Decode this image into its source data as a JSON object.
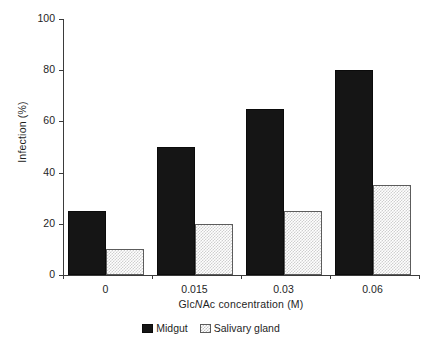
{
  "chart_data": {
    "type": "bar",
    "title": "",
    "xlabel": "GlcNAc concentration (M)",
    "xlabel_parts": {
      "pre": "Glc",
      "italic": "N",
      "post": "Ac concentration (M)"
    },
    "ylabel": "Infection (%)",
    "categories": [
      "0",
      "0.015",
      "0.03",
      "0.06"
    ],
    "series": [
      {
        "name": "Midgut",
        "values": [
          25,
          50,
          65,
          80
        ],
        "color": "#151515",
        "pattern": "solid"
      },
      {
        "name": "Salivary gland",
        "values": [
          10,
          20,
          25,
          35
        ],
        "color": "#cfcfcf",
        "pattern": "checker"
      }
    ],
    "ylim": [
      0,
      100
    ],
    "yticks": [
      0,
      20,
      40,
      60,
      80,
      100
    ],
    "ytick_labels": [
      "0",
      "20",
      "40",
      "60",
      "80",
      "100"
    ],
    "grid": false,
    "legend_position": "bottom-center",
    "axis_color": "#3b3b3b",
    "background": "#ffffff"
  },
  "legend": {
    "items": [
      {
        "label": "Midgut"
      },
      {
        "label": "Salivary gland"
      }
    ]
  }
}
